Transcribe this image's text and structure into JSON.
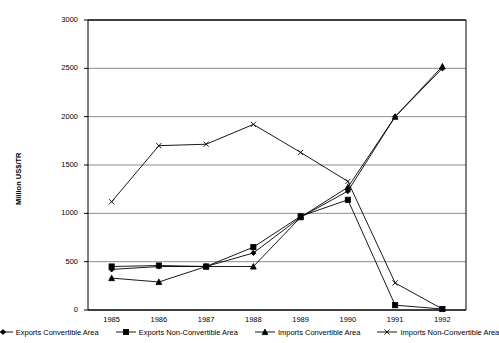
{
  "chart_data": {
    "type": "line",
    "title": "",
    "xlabel": "",
    "ylabel": "Million US$/TR",
    "ylim": [
      0,
      3000
    ],
    "ytick_values": [
      0,
      500,
      1000,
      1500,
      2000,
      2500,
      3000
    ],
    "ytick_labels": [
      "0",
      "500",
      "1000",
      "1500",
      "2000",
      "2500",
      "3000"
    ],
    "grid": "horizontal",
    "legend_position": "bottom",
    "categories": [
      "1985",
      "1986",
      "1987",
      "1988",
      "1989",
      "1990",
      "1991",
      "1992"
    ],
    "x": [
      1985,
      1986,
      1987,
      1988,
      1989,
      1990,
      1991,
      1992
    ],
    "series": [
      {
        "name": "Exports Convertible Area",
        "marker": "diamond",
        "color": "#000000",
        "values": [
          420,
          450,
          450,
          590,
          960,
          1230,
          2000,
          2500
        ]
      },
      {
        "name": "Exports Non-Convertible Area",
        "marker": "square",
        "color": "#000000",
        "values": [
          450,
          460,
          450,
          650,
          970,
          1140,
          50,
          10
        ]
      },
      {
        "name": "Imports Convertible Area",
        "marker": "triangle",
        "color": "#000000",
        "values": [
          330,
          290,
          450,
          450,
          960,
          1270,
          2000,
          2520
        ]
      },
      {
        "name": "Imports Non-Convertible Area",
        "marker": "cross",
        "color": "#000000",
        "values": [
          1120,
          1700,
          1715,
          1920,
          1630,
          1330,
          280,
          10
        ]
      }
    ]
  },
  "legend": {
    "items": [
      {
        "label": "Exports Convertible Area",
        "marker": "diamond"
      },
      {
        "label": "Exports Non-Convertible Area",
        "marker": "square"
      },
      {
        "label": "Imports Convertible Area",
        "marker": "triangle"
      },
      {
        "label": "Imports Non-Convertible Area",
        "marker": "cross"
      }
    ]
  },
  "colors": {
    "axis": "#000000",
    "grid": "#808080",
    "plot_background": "#ffffff",
    "series": "#000000"
  }
}
